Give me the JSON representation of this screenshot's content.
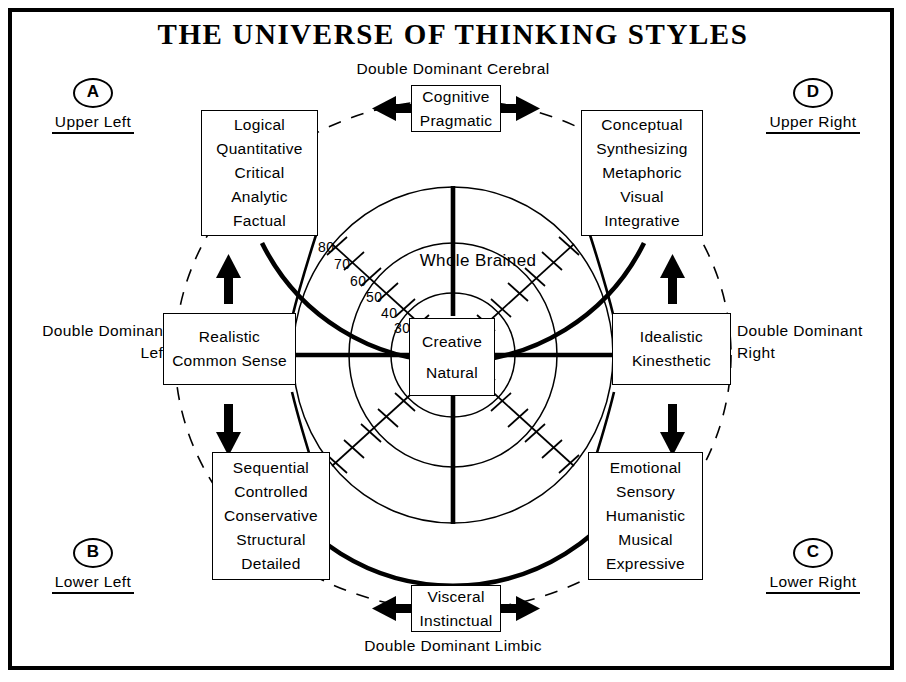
{
  "title": "THE UNIVERSE OF THINKING STYLES",
  "axis_labels": {
    "top": "Double Dominant Cerebral",
    "bottom": "Double Dominant Limbic",
    "left_line1": "Double Dominant",
    "left_line2": "Left",
    "right_line1": "Double Dominant",
    "right_line2": "Right"
  },
  "center": {
    "ring_label": "Whole Brained",
    "line1": "Creative",
    "line2": "Natural"
  },
  "scale": {
    "ticks": [
      "80",
      "70",
      "60",
      "50",
      "40",
      "30"
    ]
  },
  "corners": [
    {
      "letter": "A",
      "caption": "Upper Left"
    },
    {
      "letter": "D",
      "caption": "Upper Right"
    },
    {
      "letter": "B",
      "caption": "Lower Left"
    },
    {
      "letter": "C",
      "caption": "Lower Right"
    }
  ],
  "quadrants": {
    "upper_left": {
      "lines": [
        "Logical",
        "Quantitative",
        "Critical",
        "Analytic",
        "Factual"
      ]
    },
    "upper_right": {
      "lines": [
        "Conceptual",
        "Synthesizing",
        "Metaphoric",
        "Visual",
        "Integrative"
      ]
    },
    "lower_left": {
      "lines": [
        "Sequential",
        "Controlled",
        "Conservative",
        "Structural",
        "Detailed"
      ]
    },
    "lower_right": {
      "lines": [
        "Emotional",
        "Sensory",
        "Humanistic",
        "Musical",
        "Expressive"
      ]
    }
  },
  "axis_boxes": {
    "top": {
      "line1": "Cognitive",
      "line2": "Pragmatic"
    },
    "bottom": {
      "line1": "Visceral",
      "line2": "Instinctual"
    },
    "left": {
      "line1": "Realistic",
      "line2": "Common Sense"
    },
    "right": {
      "line1": "Idealistic",
      "line2": "Kinesthetic"
    }
  },
  "colors": {
    "ink": "#000000",
    "paper": "#ffffff"
  }
}
